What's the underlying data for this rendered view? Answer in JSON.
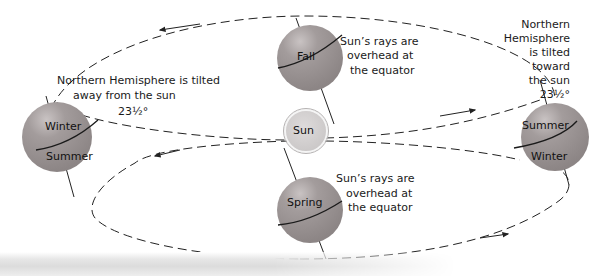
{
  "diagram": {
    "colors": {
      "globe": "#9c9696",
      "globe_highlight": "#c4bfbf",
      "sun": "#d6d3d3",
      "sun_ring": "#b3b0b0",
      "orbit_line": "#222222"
    },
    "positions": {
      "fall": {
        "label": "Fall"
      },
      "sun": {
        "label": "Sun"
      },
      "spring": {
        "label": "Spring"
      },
      "left": {
        "upper_label": "Winter",
        "lower_label": "Summer"
      },
      "right": {
        "upper_label": "Summer",
        "lower_label": "Winter"
      }
    },
    "captions": {
      "left": {
        "line1": "Northern Hemisphere is tilted",
        "line2": "away from the sun",
        "angle": "23½°"
      },
      "fall": {
        "line1": "Sun’s rays are",
        "line2": "overhead at",
        "line3": "the equator"
      },
      "spring": {
        "line1": "Sun’s rays are",
        "line2": "overhead at",
        "line3": "the equator"
      },
      "right": {
        "line1": "Northern",
        "line2": "Hemisphere",
        "line3": "is tilted",
        "line4": "toward",
        "line5": "the sun",
        "angle": "23½°"
      }
    }
  }
}
